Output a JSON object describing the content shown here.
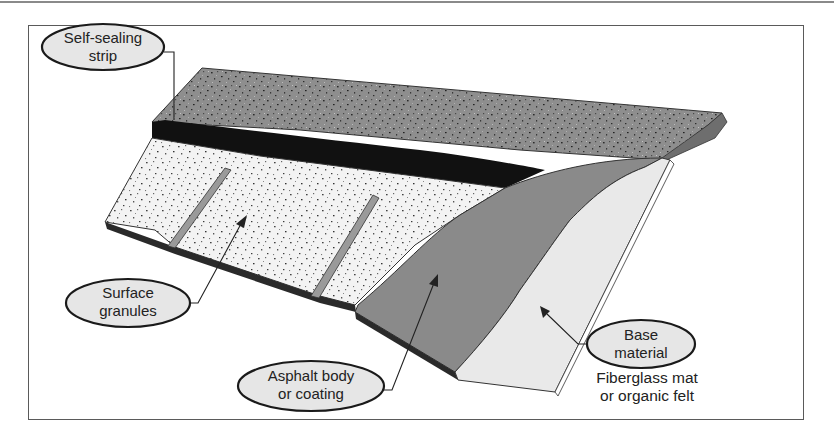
{
  "diagram": {
    "labels": {
      "self_sealing_strip": {
        "line1": "Self-sealing",
        "line2": "strip"
      },
      "surface_granules": {
        "line1": "Surface",
        "line2": "granules"
      },
      "asphalt_body": {
        "line1": "Asphalt body",
        "line2": "or coating"
      },
      "base_material": {
        "line1": "Base",
        "line2": "material",
        "note1": "Fiberglass mat",
        "note2": "or organic felt"
      }
    },
    "colors": {
      "frame": "#5a5a5a",
      "label_fill": "#e6e6e6",
      "label_stroke": "#1a1a1a",
      "top_granules": "#8e8e8e",
      "sealing_strip": "#111111",
      "lower_granules": "#f2f2f2",
      "asphalt_body": "#8a8a8a",
      "base_material": "#e9e9e9"
    }
  }
}
